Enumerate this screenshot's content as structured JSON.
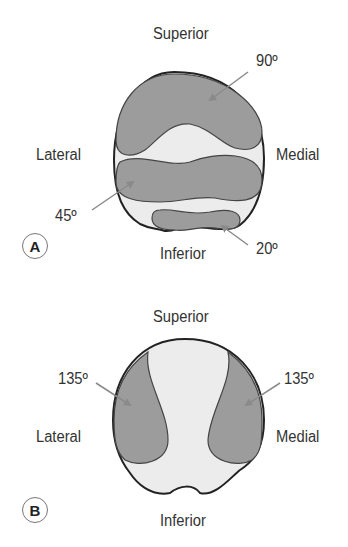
{
  "colors": {
    "shaded": "#9c9c9c",
    "unshaded": "#ececec",
    "outline": "#222222",
    "arrow": "#8a8a8a",
    "text": "#333333"
  },
  "panel_a": {
    "badge": "A",
    "labels": {
      "superior": "Superior",
      "inferior": "Inferior",
      "lateral": "Lateral",
      "medial": "Medial"
    },
    "angles": {
      "top": "90º",
      "middle": "45º",
      "bottom": "20º"
    }
  },
  "panel_b": {
    "badge": "B",
    "labels": {
      "superior": "Superior",
      "inferior": "Inferior",
      "lateral": "Lateral",
      "medial": "Medial"
    },
    "angles": {
      "left": "135º",
      "right": "135º"
    }
  }
}
